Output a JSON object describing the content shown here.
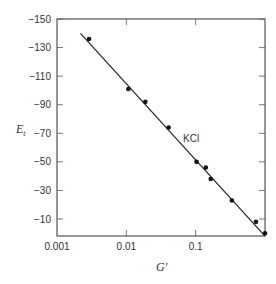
{
  "chart_data": {
    "type": "scatter",
    "title": "",
    "xlabel": "G'",
    "ylabel": "E_t",
    "xscale": "log",
    "xlim": [
      0.001,
      1.0
    ],
    "ylim": [
      0,
      -150
    ],
    "x_ticks": [
      0.001,
      0.01,
      0.1
    ],
    "x_tick_labels": [
      "0.001",
      "0.01",
      "0.1"
    ],
    "y_ticks": [
      -150,
      -130,
      -110,
      -90,
      -70,
      -50,
      -30,
      -10
    ],
    "y_tick_labels": [
      "−150",
      "−130",
      "−110",
      "−90",
      "−70",
      "−50",
      "−30",
      "−10"
    ],
    "grid": false,
    "legend": null,
    "annotations": [
      {
        "text": "KCl",
        "x": 0.11,
        "y": -62
      }
    ],
    "series": [
      {
        "name": "KCl",
        "style": "points",
        "x": [
          0.0029,
          0.0107,
          0.0188,
          0.0407,
          0.103,
          0.14,
          0.165,
          0.333,
          0.741,
          1.0
        ],
        "y": [
          -136,
          -101,
          -92,
          -74,
          -50,
          -46,
          -38,
          -23,
          -8,
          0
        ]
      },
      {
        "name": "KCl fit",
        "style": "line",
        "x": [
          0.00218,
          1.0
        ],
        "y": [
          -140,
          2
        ]
      }
    ]
  }
}
